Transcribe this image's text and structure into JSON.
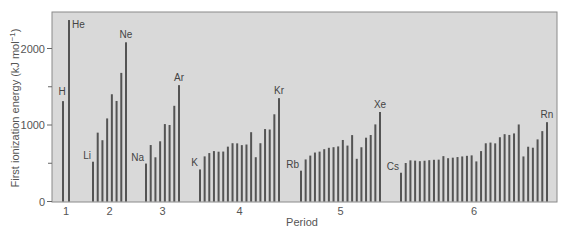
{
  "chart_data": {
    "type": "bar",
    "title": "",
    "xlabel": "Period",
    "ylabel": "First ionization energy (kJ mol⁻¹)",
    "ylim": [
      0,
      2450
    ],
    "yticks": [
      0,
      1000,
      2000
    ],
    "yminor_ticks": [
      500,
      1500
    ],
    "grid": false,
    "legend": null,
    "periods": [
      {
        "label": "1",
        "start_x": 63,
        "end_x": 69,
        "elements": [
          "H",
          "He"
        ],
        "values": [
          1312,
          2372
        ],
        "labeled": {
          "H": 0,
          "He": 1
        }
      },
      {
        "label": "2",
        "start_x": 93,
        "end_x": 126,
        "elements": [
          "Li",
          "Be",
          "B",
          "C",
          "N",
          "O",
          "F",
          "Ne"
        ],
        "values": [
          520,
          900,
          801,
          1086,
          1402,
          1314,
          1681,
          2081
        ],
        "labeled": {
          "Li": 0,
          "Ne": 7
        }
      },
      {
        "label": "3",
        "start_x": 146,
        "end_x": 179,
        "elements": [
          "Na",
          "Mg",
          "Al",
          "Si",
          "P",
          "S",
          "Cl",
          "Ar"
        ],
        "values": [
          496,
          738,
          578,
          787,
          1012,
          1000,
          1251,
          1521
        ],
        "labeled": {
          "Na": 0,
          "Ar": 7
        }
      },
      {
        "label": "4",
        "start_x": 200,
        "end_x": 279,
        "elements": [
          "K",
          "Ca",
          "Sc",
          "Ti",
          "V",
          "Cr",
          "Mn",
          "Fe",
          "Co",
          "Ni",
          "Cu",
          "Zn",
          "Ga",
          "Ge",
          "As",
          "Se",
          "Br",
          "Kr"
        ],
        "values": [
          419,
          590,
          633,
          659,
          651,
          653,
          717,
          762,
          760,
          737,
          745,
          906,
          579,
          762,
          947,
          941,
          1140,
          1351
        ],
        "labeled": {
          "K": 0,
          "Kr": 17
        }
      },
      {
        "label": "5",
        "start_x": 301,
        "end_x": 380,
        "elements": [
          "Rb",
          "Sr",
          "Y",
          "Zr",
          "Nb",
          "Mo",
          "Tc",
          "Ru",
          "Rh",
          "Pd",
          "Ag",
          "Cd",
          "In",
          "Sn",
          "Sb",
          "Te",
          "I",
          "Xe"
        ],
        "values": [
          403,
          550,
          600,
          640,
          652,
          684,
          702,
          710,
          720,
          804,
          731,
          868,
          558,
          709,
          834,
          869,
          1008,
          1170
        ],
        "labeled": {
          "Rb": 0,
          "Xe": 17
        }
      },
      {
        "label": "6",
        "start_x": 401,
        "end_x": 547,
        "elements": [
          "Cs",
          "Ba",
          "La",
          "Ce",
          "Pr",
          "Nd",
          "Pm",
          "Sm",
          "Eu",
          "Gd",
          "Tb",
          "Dy",
          "Ho",
          "Er",
          "Tm",
          "Yb",
          "Lu",
          "Hf",
          "Ta",
          "W",
          "Re",
          "Os",
          "Ir",
          "Pt",
          "Au",
          "Hg",
          "Tl",
          "Pb",
          "Bi",
          "Po",
          "At",
          "Rn"
        ],
        "values": [
          376,
          503,
          538,
          534,
          527,
          533,
          540,
          545,
          547,
          593,
          566,
          573,
          581,
          589,
          597,
          603,
          524,
          659,
          761,
          770,
          760,
          840,
          880,
          870,
          890,
          1007,
          589,
          716,
          703,
          812,
          920,
          1037
        ],
        "labeled": {
          "Cs": 0,
          "Rn": 31
        }
      }
    ]
  },
  "axes": {
    "y_title": "First ionization energy (kJ mol",
    "y_title_sup": "−1",
    "y_title_end": ")",
    "x_title": "Period",
    "ytick_labels": [
      "0",
      "1000",
      "2000"
    ]
  }
}
